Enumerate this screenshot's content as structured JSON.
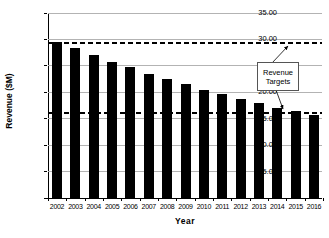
{
  "chart_data": {
    "type": "bar",
    "title": "",
    "xlabel": "Year",
    "ylabel": "Revenue ($M)",
    "categories": [
      "2002",
      "2003",
      "2004",
      "2005",
      "2006",
      "2007",
      "2008",
      "2009",
      "2010",
      "2011",
      "2012",
      "2013",
      "2014",
      "2015",
      "2016"
    ],
    "values": [
      29.6,
      28.3,
      27.0,
      25.8,
      24.7,
      23.5,
      22.5,
      21.5,
      20.5,
      19.6,
      18.8,
      17.9,
      17.1,
      16.4,
      15.7
    ],
    "ylim": [
      0,
      35
    ],
    "ytick_step": 5,
    "ytick_labels": [
      "35.00",
      "30.00",
      "25.00",
      "20.00",
      "15.00",
      "10.00",
      "5.00",
      "-"
    ],
    "grid": true,
    "legend": "none",
    "bar_color": "#000000",
    "gridline_color": "#b3b3b3",
    "target_lines": [
      {
        "value": 29.3,
        "style": "dashed",
        "color": "#000000"
      },
      {
        "value": 16.1,
        "style": "dashed",
        "color": "#000000"
      }
    ],
    "annotation": {
      "label": "Revenue Targets",
      "line1": "Revenue",
      "line2": "Targets"
    }
  }
}
